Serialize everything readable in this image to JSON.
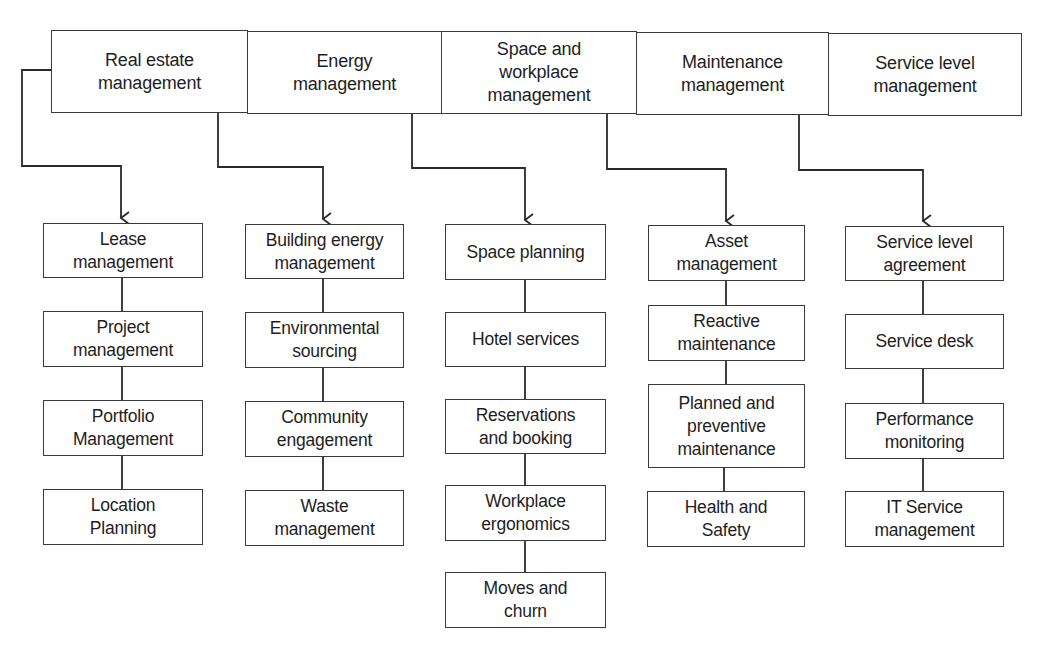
{
  "diagram": {
    "type": "hierarchy",
    "colors": {
      "line": "#2a2a2a",
      "box_border": "#3a3a3a",
      "text": "#1e1e1e",
      "background": "#ffffff"
    },
    "categories": [
      {
        "label": "Real estate\nmanagement",
        "children": [
          "Lease\nmanagement",
          "Project\nmanagement",
          "Portfolio\nManagement",
          "Location\nPlanning"
        ]
      },
      {
        "label": "Energy\nmanagement",
        "children": [
          "Building energy\nmanagement",
          "Environmental\nsourcing",
          "Community\nengagement",
          "Waste\nmanagement"
        ]
      },
      {
        "label": "Space and\nworkplace\nmanagement",
        "children": [
          "Space planning",
          "Hotel services",
          "Reservations\nand booking",
          "Workplace\nergonomics",
          "Moves and\nchurn"
        ]
      },
      {
        "label": "Maintenance\nmanagement",
        "children": [
          "Asset\nmanagement",
          "Reactive\nmaintenance",
          "Planned and\npreventive\nmaintenance",
          "Health and\nSafety"
        ]
      },
      {
        "label": "Service level\nmanagement",
        "children": [
          "Service level\nagreement",
          "Service desk",
          "Performance\nmonitoring",
          "IT Service\nmanagement"
        ]
      }
    ]
  }
}
